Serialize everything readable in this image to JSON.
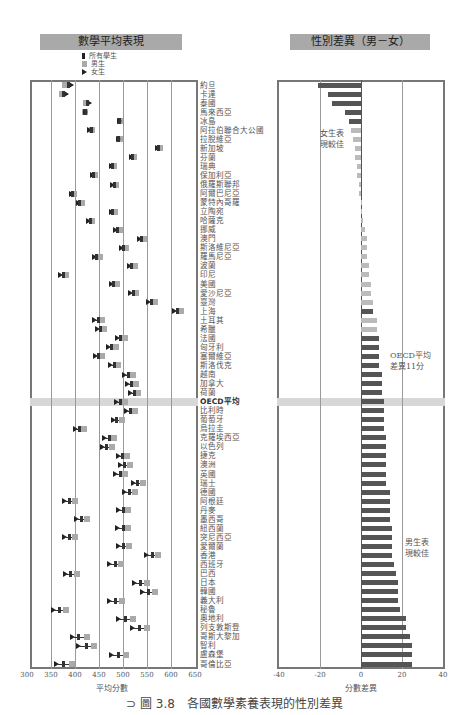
{
  "left_panel": {
    "title": "數學平均表現",
    "legend": [
      "所有學生",
      "男生",
      "女生"
    ],
    "xlabel": "平均分數"
  },
  "right_panel": {
    "title": "性別差異（男－女）",
    "xlabel": "分數差異",
    "note_girls": [
      "女生表",
      "現較佳"
    ],
    "note_boys": [
      "男生表",
      "現較佳"
    ],
    "note_oecd": [
      "OECD平均",
      "差異11分"
    ]
  },
  "caption": "⊃ 圖 3.8　各國數學素養表現的性別差異",
  "colors": {
    "boys": "#aaaaaa",
    "all": "#333333",
    "girls": "#222222",
    "bar_dark": "#555555",
    "bar_light": "#bbbbbb",
    "title_bg": "#a9a9a9"
  },
  "chart_data": [
    {
      "type": "scatter",
      "title": "數學平均表現",
      "xlabel": "平均分數",
      "xlim": [
        300,
        650
      ],
      "xticks": [
        300,
        350,
        400,
        450,
        500,
        550,
        600,
        650
      ],
      "legend": [
        "所有學生",
        "男生",
        "女生"
      ],
      "categories": [
        "約旦",
        "卡達",
        "泰國",
        "馬來西亞",
        "冰島",
        "阿拉伯聯合大公國",
        "拉脫維亞",
        "新加坡",
        "芬蘭",
        "瑞典",
        "保加利亞",
        "俄羅斯聯邦",
        "阿爾巴尼亞",
        "蒙特內哥羅",
        "立陶宛",
        "哈薩克",
        "挪威",
        "澳門",
        "斯洛維尼亞",
        "羅馬尼亞",
        "波蘭",
        "印尼",
        "美國",
        "愛沙尼亞",
        "臺灣",
        "上海",
        "土耳其",
        "希臘",
        "法國",
        "匈牙利",
        "塞爾維亞",
        "斯洛伐克",
        "越南",
        "加拿大",
        "荷蘭",
        "OECD平均",
        "比利時",
        "葡萄牙",
        "烏拉圭",
        "克羅埃西亞",
        "以色列",
        "捷克",
        "澳洲",
        "英國",
        "瑞士",
        "德國",
        "阿根廷",
        "丹麥",
        "墨西哥",
        "紐西蘭",
        "突尼西亞",
        "愛爾蘭",
        "香港",
        "西班牙",
        "巴西",
        "日本",
        "韓國",
        "義大利",
        "秘魯",
        "奧地利",
        "列支敦斯登",
        "哥斯大黎加",
        "智利",
        "盧森堡",
        "哥倫比亞"
      ],
      "series": [
        {
          "name": "所有學生",
          "values": [
            386,
            376,
            427,
            421,
            493,
            434,
            491,
            573,
            519,
            478,
            439,
            482,
            394,
            410,
            479,
            432,
            489,
            538,
            501,
            445,
            518,
            375,
            481,
            521,
            560,
            613,
            448,
            453,
            495,
            477,
            449,
            482,
            511,
            518,
            523,
            494,
            515,
            487,
            409,
            471,
            466,
            499,
            504,
            494,
            531,
            514,
            388,
            500,
            413,
            500,
            388,
            501,
            561,
            484,
            391,
            536,
            554,
            485,
            368,
            506,
            535,
            407,
            423,
            490,
            376
          ]
        },
        {
          "name": "男生",
          "values": [
            375,
            369,
            419,
            416,
            490,
            432,
            489,
            572,
            518,
            477,
            438,
            481,
            394,
            410,
            479,
            432,
            490,
            540,
            503,
            447,
            520,
            377,
            484,
            523,
            563,
            616,
            452,
            457,
            499,
            482,
            453,
            486,
            517,
            523,
            528,
            499,
            520,
            493,
            415,
            477,
            472,
            505,
            510,
            500,
            537,
            520,
            396,
            507,
            420,
            507,
            396,
            509,
            568,
            492,
            401,
            545,
            562,
            494,
            378,
            517,
            546,
            420,
            436,
            502,
            390
          ]
        },
        {
          "name": "女生",
          "values": [
            396,
            385,
            433,
            424,
            496,
            434,
            493,
            575,
            520,
            479,
            440,
            482,
            395,
            410,
            479,
            432,
            488,
            537,
            499,
            443,
            516,
            373,
            479,
            519,
            557,
            610,
            444,
            449,
            491,
            473,
            445,
            478,
            507,
            513,
            518,
            489,
            510,
            483,
            404,
            465,
            461,
            494,
            498,
            488,
            525,
            507,
            381,
            493,
            406,
            492,
            381,
            494,
            553,
            476,
            384,
            527,
            544,
            476,
            359,
            494,
            523,
            398,
            411,
            480,
            364
          ]
        }
      ]
    },
    {
      "type": "bar",
      "orientation": "horizontal",
      "title": "性別差異（男－女）",
      "xlabel": "分數差異",
      "xlim": [
        -40,
        40
      ],
      "xticks": [
        -40,
        -20,
        0,
        20,
        40
      ],
      "annotations": [
        "女生表現較佳",
        "OECD平均差異11分",
        "男生表現較佳"
      ],
      "categories": [
        "約旦",
        "卡達",
        "泰國",
        "馬來西亞",
        "冰島",
        "阿拉伯聯合大公國",
        "拉脫維亞",
        "新加坡",
        "芬蘭",
        "瑞典",
        "保加利亞",
        "俄羅斯聯邦",
        "阿爾巴尼亞",
        "蒙特內哥羅",
        "立陶宛",
        "哈薩克",
        "挪威",
        "澳門",
        "斯洛維尼亞",
        "羅馬尼亞",
        "波蘭",
        "印尼",
        "美國",
        "愛沙尼亞",
        "臺灣",
        "上海",
        "土耳其",
        "希臘",
        "法國",
        "匈牙利",
        "塞爾維亞",
        "斯洛伐克",
        "越南",
        "加拿大",
        "荷蘭",
        "OECD平均",
        "比利時",
        "葡萄牙",
        "烏拉圭",
        "克羅埃西亞",
        "以色列",
        "捷克",
        "澳洲",
        "英國",
        "瑞士",
        "德國",
        "阿根廷",
        "丹麥",
        "墨西哥",
        "紐西蘭",
        "突尼西亞",
        "愛爾蘭",
        "香港",
        "西班牙",
        "巴西",
        "日本",
        "韓國",
        "義大利",
        "秘魯",
        "奧地利",
        "列支敦斯登",
        "哥斯大黎加",
        "智利",
        "盧森堡",
        "哥倫比亞"
      ],
      "values": [
        -21,
        -16,
        -14,
        -8,
        -6,
        -5,
        -4,
        -3,
        -3,
        -2,
        -2,
        -1,
        -1,
        0,
        0,
        1,
        2,
        3,
        3,
        3,
        4,
        4,
        5,
        5,
        6,
        6,
        8,
        8,
        9,
        9,
        9,
        9,
        10,
        10,
        10,
        11,
        11,
        11,
        11,
        12,
        12,
        12,
        12,
        12,
        12,
        14,
        14,
        14,
        14,
        15,
        15,
        15,
        15,
        16,
        17,
        18,
        18,
        18,
        19,
        22,
        22,
        24,
        25,
        25,
        25
      ],
      "significant": [
        true,
        true,
        true,
        true,
        true,
        false,
        false,
        false,
        false,
        false,
        false,
        false,
        false,
        false,
        false,
        false,
        false,
        false,
        false,
        false,
        false,
        false,
        false,
        false,
        false,
        true,
        false,
        false,
        true,
        true,
        true,
        true,
        true,
        true,
        true,
        true,
        true,
        true,
        true,
        true,
        true,
        true,
        true,
        true,
        true,
        true,
        true,
        true,
        true,
        true,
        true,
        true,
        true,
        true,
        true,
        true,
        true,
        true,
        true,
        true,
        true,
        true,
        true,
        true,
        true
      ]
    }
  ]
}
